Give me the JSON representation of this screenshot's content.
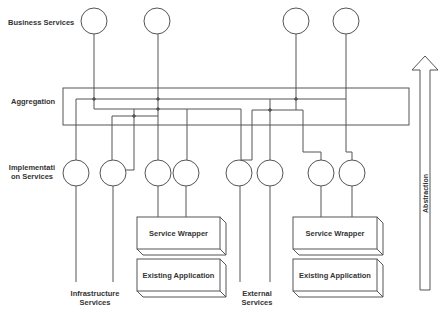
{
  "diagram": {
    "layers": {
      "business": "Business Services",
      "aggregation": "Aggregation",
      "implementation_line1": "Implementati",
      "implementation_line2": "on Services"
    },
    "groups": {
      "infrastructure_line1": "Infrastructure",
      "infrastructure_line2": "Services",
      "external_line1": "External",
      "external_line2": "Services"
    },
    "stacks": [
      {
        "top": "Service Wrapper",
        "bottom": "Existing Application"
      },
      {
        "top": "Service Wrapper",
        "bottom": "Existing Application"
      }
    ],
    "arrow": {
      "label": "Abstraction",
      "direction": "up"
    },
    "business_service_count": 4,
    "implementation_service_count": 8,
    "colors": {
      "stroke": "#555555",
      "text": "#333333",
      "background": "#ffffff"
    }
  }
}
